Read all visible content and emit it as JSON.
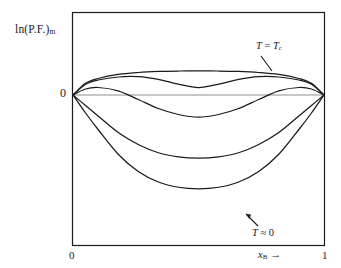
{
  "figure": {
    "type": "line-plot",
    "background": "#ffffff",
    "frame_color": "#1a1a1a",
    "curve_color": "#1a1a1a",
    "zero_line_color": "#8a8a8a"
  },
  "axes": {
    "ylabel_text": "ln(P.F.)",
    "ylabel_sub": "m",
    "zero_label": "0",
    "xlabel_text": "x",
    "xlabel_sub": "B",
    "xlabel_arrow": "→",
    "xtick_left": "0",
    "xtick_right": "1"
  },
  "annotations": {
    "top_curve": {
      "lead": "T",
      "eq": " = ",
      "var": "T",
      "sub": "c"
    },
    "bottom_curve": {
      "lead": "T",
      "approx": " ≈ ",
      "value": "0"
    }
  },
  "chart_data": {
    "type": "line",
    "title": "",
    "xlabel": "x_B",
    "ylabel": "ln(P.F.)_m",
    "xlim": [
      0,
      1
    ],
    "ylim": [
      -1.0,
      0.25
    ],
    "grid": false,
    "legend": "inline-annotations",
    "zero_line": 0,
    "series": [
      {
        "name": "T = T_c",
        "label": "T = T_c",
        "annotated": true,
        "x": [
          0.0,
          0.05,
          0.1,
          0.18,
          0.26,
          0.34,
          0.42,
          0.5,
          0.58,
          0.66,
          0.74,
          0.82,
          0.9,
          0.95,
          1.0
        ],
        "y": [
          0.0,
          0.078,
          0.11,
          0.137,
          0.15,
          0.157,
          0.16,
          0.161,
          0.16,
          0.157,
          0.15,
          0.137,
          0.11,
          0.078,
          0.0
        ]
      },
      {
        "name": "curve-2",
        "label": "",
        "annotated": false,
        "x": [
          0.0,
          0.05,
          0.1,
          0.18,
          0.26,
          0.34,
          0.42,
          0.5,
          0.58,
          0.66,
          0.74,
          0.82,
          0.9,
          0.95,
          1.0
        ],
        "y": [
          0.0,
          0.072,
          0.1,
          0.12,
          0.122,
          0.104,
          0.072,
          0.05,
          0.072,
          0.104,
          0.122,
          0.12,
          0.1,
          0.072,
          0.0
        ]
      },
      {
        "name": "curve-3",
        "label": "",
        "annotated": false,
        "x": [
          0.0,
          0.05,
          0.1,
          0.18,
          0.26,
          0.34,
          0.42,
          0.5,
          0.58,
          0.66,
          0.74,
          0.82,
          0.9,
          0.95,
          1.0
        ],
        "y": [
          0.0,
          0.04,
          0.05,
          0.028,
          -0.03,
          -0.09,
          -0.13,
          -0.148,
          -0.13,
          -0.09,
          -0.03,
          0.028,
          0.05,
          0.04,
          0.0
        ]
      },
      {
        "name": "T = 0",
        "label": "T ≈ 0",
        "annotated": true,
        "x": [
          0.0,
          0.05,
          0.1,
          0.18,
          0.26,
          0.34,
          0.42,
          0.5,
          0.58,
          0.66,
          0.74,
          0.82,
          0.9,
          0.95,
          1.0
        ],
        "y": [
          0.0,
          -0.12,
          -0.23,
          -0.395,
          -0.51,
          -0.58,
          -0.615,
          -0.625,
          -0.615,
          -0.58,
          -0.51,
          -0.395,
          -0.23,
          -0.12,
          0.0
        ]
      }
    ],
    "extra_series": [
      {
        "name": "curve-mid",
        "label": "",
        "annotated": false,
        "x": [
          0.0,
          0.05,
          0.1,
          0.18,
          0.26,
          0.34,
          0.42,
          0.5,
          0.58,
          0.66,
          0.74,
          0.82,
          0.9,
          0.95,
          1.0
        ],
        "y": [
          0.0,
          -0.07,
          -0.14,
          -0.25,
          -0.33,
          -0.385,
          -0.412,
          -0.42,
          -0.412,
          -0.385,
          -0.33,
          -0.25,
          -0.14,
          -0.07,
          0.0
        ]
      }
    ]
  }
}
